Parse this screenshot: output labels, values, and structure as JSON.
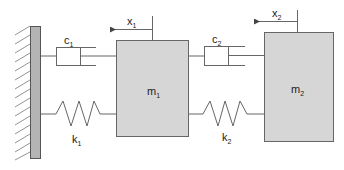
{
  "diagram": {
    "type": "two-mass spring-damper system",
    "wall": {
      "fill": "#b4b4b4",
      "stroke": "#555555"
    },
    "masses": [
      {
        "label": "m",
        "subscript": "1",
        "fill": "#d6d6d6"
      },
      {
        "label": "m",
        "subscript": "2",
        "fill": "#d6d6d6"
      }
    ],
    "dampers": [
      {
        "label": "c",
        "subscript": "1"
      },
      {
        "label": "c",
        "subscript": "2"
      }
    ],
    "springs": [
      {
        "label": "k",
        "subscript": "1"
      },
      {
        "label": "k",
        "subscript": "2"
      }
    ],
    "displacements": [
      {
        "label": "x",
        "subscript": "1",
        "direction": "left"
      },
      {
        "label": "x",
        "subscript": "2",
        "direction": "left"
      }
    ]
  }
}
